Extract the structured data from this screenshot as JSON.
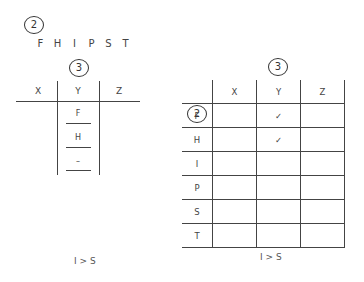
{
  "left": {
    "group_marker": "2",
    "letters": [
      "F",
      "H",
      "I",
      "P",
      "S",
      "T"
    ],
    "column_marker": "3",
    "tchart": {
      "columns": [
        "X",
        "Y",
        "Z"
      ],
      "y_entries": [
        "F",
        "H",
        "–"
      ]
    },
    "relation": "I > S"
  },
  "right": {
    "row_marker": "2",
    "column_marker": "3",
    "grid": {
      "columns": [
        "X",
        "Y",
        "Z"
      ],
      "rows": [
        {
          "label": "F",
          "cells": [
            "",
            "✓",
            ""
          ]
        },
        {
          "label": "H",
          "cells": [
            "",
            "✓",
            ""
          ]
        },
        {
          "label": "I",
          "cells": [
            "",
            "",
            ""
          ]
        },
        {
          "label": "P",
          "cells": [
            "",
            "",
            ""
          ]
        },
        {
          "label": "S",
          "cells": [
            "",
            "",
            ""
          ]
        },
        {
          "label": "T",
          "cells": [
            "",
            "",
            ""
          ]
        }
      ]
    },
    "relation": "I > S"
  }
}
